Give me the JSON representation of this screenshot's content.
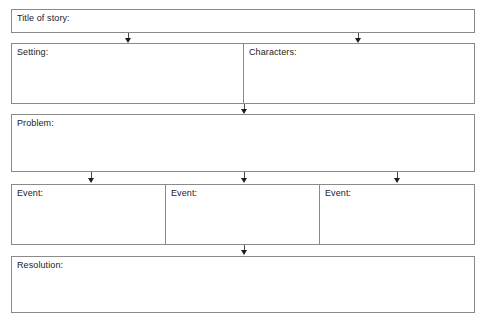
{
  "document": {
    "type": "story-map-graphic-organizer",
    "width": 488,
    "height": 326,
    "background_color": "#ffffff",
    "border_color": "#8a8a8a",
    "text_color": "#1b1b1b",
    "arrow_color": "#1d1d1d"
  },
  "boxes": {
    "title": {
      "label": "Title of story:"
    },
    "setting": {
      "label": "Setting:"
    },
    "characters": {
      "label": "Characters:"
    },
    "problem": {
      "label": "Problem:"
    },
    "event1": {
      "label": "Event:"
    },
    "event2": {
      "label": "Event:"
    },
    "event3": {
      "label": "Event:"
    },
    "resolution": {
      "label": "Resolution:"
    }
  },
  "connectors": [
    {
      "name": "title-to-setting",
      "from": "title",
      "to": "setting"
    },
    {
      "name": "title-to-characters",
      "from": "title",
      "to": "characters"
    },
    {
      "name": "setting-to-problem",
      "from": "setting",
      "to": "problem"
    },
    {
      "name": "problem-to-event1",
      "from": "problem",
      "to": "event1"
    },
    {
      "name": "problem-to-event2",
      "from": "problem",
      "to": "event2"
    },
    {
      "name": "problem-to-event3",
      "from": "problem",
      "to": "event3"
    },
    {
      "name": "events-to-resolution",
      "from": "event2",
      "to": "resolution"
    }
  ]
}
